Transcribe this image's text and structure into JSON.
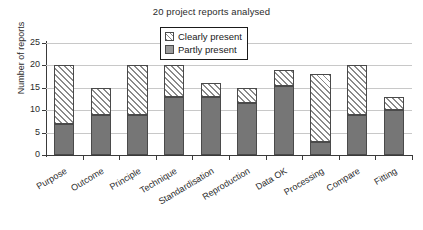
{
  "chart_data": {
    "type": "bar",
    "title": "20 project reports analysed",
    "xlabel": "",
    "ylabel": "Number of reports",
    "ylim": [
      0,
      25
    ],
    "yticks": [
      0,
      5,
      10,
      15,
      20,
      25
    ],
    "grid": true,
    "stacked": true,
    "legend_position": "top-center",
    "categories": [
      "Purpose",
      "Outcome",
      "Principle",
      "Technique",
      "Standardisation",
      "Reproduction",
      "Data OK",
      "Processing",
      "Compare",
      "Fitting"
    ],
    "series": [
      {
        "name": "Partly present",
        "color": "#767676",
        "values": [
          7,
          9,
          9,
          13,
          13,
          11.5,
          15.5,
          3,
          9,
          10
        ]
      },
      {
        "name": "Clearly present",
        "color": "#ffffff",
        "values": [
          13,
          6,
          11,
          7,
          3,
          3.5,
          3.5,
          15,
          11,
          3
        ]
      }
    ],
    "totals": [
      20,
      15,
      20,
      20,
      16,
      15,
      19,
      18,
      20,
      13
    ]
  },
  "legend": {
    "items": [
      {
        "label": "Clearly present",
        "swatch": "hatched"
      },
      {
        "label": "Partly present",
        "swatch": "solid-gray"
      }
    ]
  }
}
